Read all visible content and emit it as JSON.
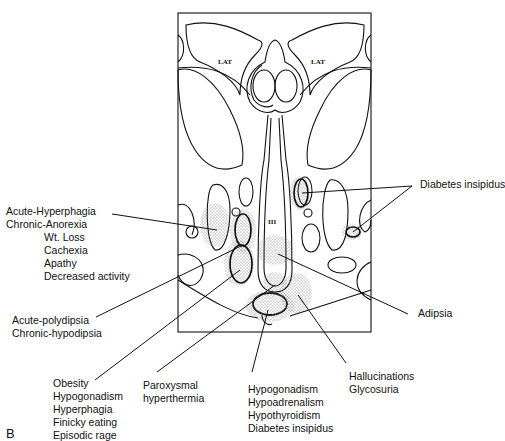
{
  "figure": {
    "panel_letter": "B",
    "region_labels": {
      "lat_left": "LAT",
      "lat_right": "LAT",
      "third_ventricle": "III"
    },
    "annotations": [
      {
        "id": "hyperphagia",
        "lines": [
          "Acute-Hyperphagia",
          "Chronic-Anorexia",
          "Wt. Loss",
          "Cachexia",
          "Apathy",
          "Decreased activity"
        ]
      },
      {
        "id": "polydipsia",
        "lines": [
          "Acute-polydipsia",
          "Chronic-hypodipsia"
        ]
      },
      {
        "id": "obesity",
        "lines": [
          "Obesity",
          "Hypogonadism",
          "Hyperphagia",
          "Finicky eating",
          "Episodic rage"
        ]
      },
      {
        "id": "hyperthermia",
        "lines": [
          "Paroxysmal",
          "hyperthermia"
        ]
      },
      {
        "id": "hypogonadism",
        "lines": [
          "Hypogonadism",
          "Hypoadrenalism",
          "Hypothyroidism",
          "Diabetes insipidus"
        ]
      },
      {
        "id": "hallucinations",
        "lines": [
          "Hallucinations",
          "Glycosuria"
        ]
      },
      {
        "id": "adipsia",
        "lines": [
          "Adipsia"
        ]
      },
      {
        "id": "diabetes_insipidus",
        "lines": [
          "Diabetes insipidus"
        ]
      }
    ],
    "colors": {
      "stroke": "#111111",
      "stipple": "#777777",
      "background": "#ffffff"
    }
  }
}
